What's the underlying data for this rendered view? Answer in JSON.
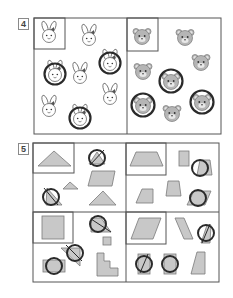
{
  "question_4": {
    "number": "4",
    "left_panel": {
      "sample": "rabbit-face",
      "items": [
        "rabbit-face",
        "rabbit-face-circled",
        "rabbit-face",
        "rabbit-face-circled",
        "rabbit-face",
        "rabbit-face",
        "rabbit-face-circled"
      ],
      "circled_count": 3
    },
    "right_panel": {
      "sample": "bear-face",
      "items": [
        "bear-face",
        "bear-face",
        "bear-face-circled",
        "bear-face",
        "bear-face-circled",
        "bear-face",
        "bear-face-circled"
      ],
      "circled_count": 3
    }
  },
  "question_5": {
    "number": "5",
    "panels": [
      {
        "sample": "triangle",
        "items": [
          "triangle-circled",
          "small-triangle",
          "parallelogram",
          "triangle-circled",
          "triangle"
        ]
      },
      {
        "sample": "trapezoid",
        "items": [
          "small-rectangle",
          "trapezoid-circled",
          "trapezoid",
          "trapezoid",
          "parallelogram-circled"
        ]
      },
      {
        "sample": "square",
        "items": [
          "triangle-circled",
          "small-square",
          "triangle-circled",
          "staircase",
          "rectangle-circled"
        ]
      },
      {
        "sample": "parallelogram",
        "items": [
          "slanted-parallelogram",
          "parallelogram-circled",
          "parallelogram-circled",
          "rectangle-circled",
          "right-trapezoid"
        ]
      }
    ]
  },
  "colors": {
    "border": "#555555",
    "shape_fill": "#c8c8c8",
    "shape_stroke": "#7a7a7a",
    "circle_mark": "#2a2a2a",
    "bear_fill": "#b5b5b5"
  }
}
